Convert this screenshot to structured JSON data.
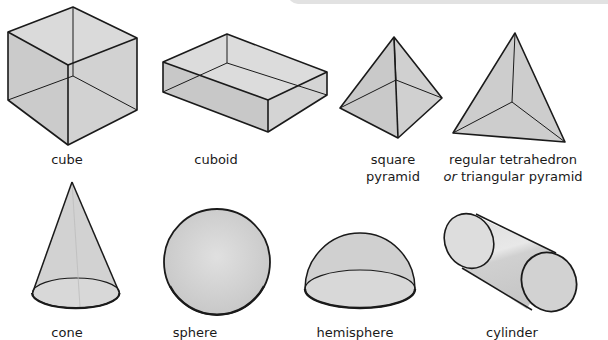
{
  "colors": {
    "face": "#cfcfcf",
    "face_light": "#dedede",
    "edge": "#1a1a1a",
    "band": "#e2e2e2"
  },
  "shapes": [
    {
      "id": "cube",
      "label": "cube"
    },
    {
      "id": "cuboid",
      "label": "cuboid"
    },
    {
      "id": "square-pyramid",
      "label_line1": "square",
      "label_line2": "pyramid"
    },
    {
      "id": "tetrahedron",
      "label_line1": "regular tetrahedron",
      "label_line2_prefix": "or",
      "label_line2_rest": " triangular pyramid"
    },
    {
      "id": "cone",
      "label": "cone"
    },
    {
      "id": "sphere",
      "label": "sphere"
    },
    {
      "id": "hemisphere",
      "label": "hemisphere"
    },
    {
      "id": "cylinder",
      "label": "cylinder"
    }
  ]
}
